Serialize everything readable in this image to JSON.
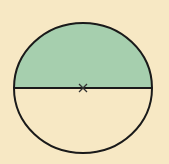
{
  "diagram": {
    "type": "semicircle-shading",
    "colors": {
      "background": "#f7e8c4",
      "shaded_region": "#a6cfae",
      "unshaded_region": "#f7e8c4",
      "outline": "#1a1a1a",
      "center_mark": "#333333"
    },
    "circle": {
      "cx": 83,
      "cy": 88,
      "rx": 69,
      "ry": 65
    },
    "shaded_half": "top",
    "center_mark_symbol": "x"
  }
}
